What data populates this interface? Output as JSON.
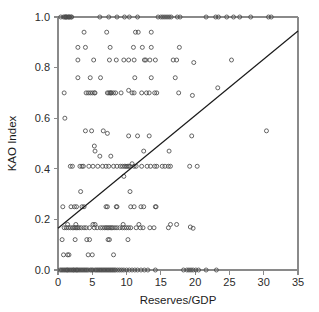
{
  "chart_data": {
    "type": "scatter",
    "title": "",
    "xlabel": "Reserves/GDP",
    "ylabel": "KAO Index",
    "xlim": [
      0,
      35
    ],
    "ylim": [
      0.0,
      1.0
    ],
    "xticks": [
      0,
      5,
      10,
      15,
      20,
      25,
      30,
      35
    ],
    "xtick_labels": [
      "0",
      "5",
      "10",
      "15",
      "20",
      "25",
      "30",
      "35"
    ],
    "yticks": [
      0.0,
      0.2,
      0.4,
      0.6,
      0.8,
      1.0
    ],
    "ytick_labels": [
      "0.0",
      "0.2",
      "0.4",
      "0.6",
      "0.8",
      "1.0"
    ],
    "grid": false,
    "legend": null,
    "marker": "open-circle",
    "marker_size": 4,
    "marker_color": "#4a4a4a",
    "series": [
      {
        "name": "Country observations",
        "points": [
          [
            0.4,
            1.0
          ],
          [
            0.8,
            1.0
          ],
          [
            1.0,
            1.0
          ],
          [
            1.1,
            1.0
          ],
          [
            1.2,
            1.0
          ],
          [
            1.3,
            1.0
          ],
          [
            1.5,
            1.0
          ],
          [
            1.6,
            1.0
          ],
          [
            1.7,
            1.0
          ],
          [
            1.9,
            1.0
          ],
          [
            2.0,
            1.0
          ],
          [
            6.1,
            1.0
          ],
          [
            7.4,
            1.0
          ],
          [
            8.6,
            1.0
          ],
          [
            9.7,
            1.0
          ],
          [
            10.4,
            1.0
          ],
          [
            11.6,
            1.0
          ],
          [
            14.6,
            1.0
          ],
          [
            15.0,
            1.0
          ],
          [
            15.3,
            1.0
          ],
          [
            15.6,
            1.0
          ],
          [
            15.9,
            1.0
          ],
          [
            16.2,
            1.0
          ],
          [
            16.5,
            1.0
          ],
          [
            17.4,
            1.0
          ],
          [
            17.8,
            1.0
          ],
          [
            21.6,
            1.0
          ],
          [
            23.0,
            1.0
          ],
          [
            23.4,
            1.0
          ],
          [
            24.6,
            1.0
          ],
          [
            25.6,
            1.0
          ],
          [
            26.5,
            1.0
          ],
          [
            28.1,
            1.0
          ],
          [
            30.7,
            1.0
          ],
          [
            31.1,
            1.0
          ],
          [
            3.8,
            0.94
          ],
          [
            7.1,
            0.94
          ],
          [
            11.3,
            0.94
          ],
          [
            11.7,
            0.94
          ],
          [
            13.6,
            0.94
          ],
          [
            2.9,
            0.88
          ],
          [
            4.0,
            0.88
          ],
          [
            7.6,
            0.88
          ],
          [
            11.0,
            0.88
          ],
          [
            12.3,
            0.88
          ],
          [
            13.6,
            0.88
          ],
          [
            17.7,
            0.88
          ],
          [
            2.9,
            0.83
          ],
          [
            5.2,
            0.83
          ],
          [
            7.5,
            0.83
          ],
          [
            8.5,
            0.83
          ],
          [
            9.6,
            0.83
          ],
          [
            10.3,
            0.83
          ],
          [
            11.1,
            0.83
          ],
          [
            12.6,
            0.83
          ],
          [
            12.8,
            0.83
          ],
          [
            13.4,
            0.83
          ],
          [
            14.2,
            0.83
          ],
          [
            16.8,
            0.83
          ],
          [
            17.3,
            0.83
          ],
          [
            19.8,
            0.82
          ],
          [
            25.3,
            0.83
          ],
          [
            2.9,
            0.76
          ],
          [
            4.7,
            0.76
          ],
          [
            6.2,
            0.76
          ],
          [
            11.2,
            0.76
          ],
          [
            13.6,
            0.76
          ],
          [
            17.1,
            0.76
          ],
          [
            23.3,
            0.72
          ],
          [
            0.9,
            0.7
          ],
          [
            4.1,
            0.7
          ],
          [
            4.4,
            0.7
          ],
          [
            4.7,
            0.7
          ],
          [
            5.0,
            0.7
          ],
          [
            5.3,
            0.7
          ],
          [
            5.4,
            0.7
          ],
          [
            7.2,
            0.7
          ],
          [
            7.4,
            0.7
          ],
          [
            7.6,
            0.7
          ],
          [
            7.7,
            0.7
          ],
          [
            7.8,
            0.7
          ],
          [
            8.1,
            0.7
          ],
          [
            8.4,
            0.7
          ],
          [
            9.2,
            0.7
          ],
          [
            10.3,
            0.71
          ],
          [
            10.8,
            0.7
          ],
          [
            11.1,
            0.7
          ],
          [
            12.2,
            0.7
          ],
          [
            12.9,
            0.7
          ],
          [
            13.3,
            0.7
          ],
          [
            14.1,
            0.7
          ],
          [
            14.4,
            0.7
          ],
          [
            17.6,
            0.7
          ],
          [
            19.6,
            0.69
          ],
          [
            1.0,
            0.6
          ],
          [
            4.0,
            0.55
          ],
          [
            4.9,
            0.55
          ],
          [
            6.6,
            0.55
          ],
          [
            30.4,
            0.55
          ],
          [
            10.3,
            0.53
          ],
          [
            11.6,
            0.53
          ],
          [
            13.3,
            0.53
          ],
          [
            19.5,
            0.53
          ],
          [
            7.2,
            0.54
          ],
          [
            5.3,
            0.49
          ],
          [
            5.4,
            0.47
          ],
          [
            12.5,
            0.47
          ],
          [
            16.2,
            0.47
          ],
          [
            6.1,
            0.45
          ],
          [
            7.7,
            0.45
          ],
          [
            1.8,
            0.41
          ],
          [
            2.1,
            0.41
          ],
          [
            3.2,
            0.41
          ],
          [
            3.5,
            0.41
          ],
          [
            3.7,
            0.41
          ],
          [
            4.5,
            0.41
          ],
          [
            5.1,
            0.41
          ],
          [
            5.8,
            0.41
          ],
          [
            6.5,
            0.41
          ],
          [
            7.0,
            0.41
          ],
          [
            7.4,
            0.41
          ],
          [
            8.1,
            0.41
          ],
          [
            8.6,
            0.41
          ],
          [
            9.1,
            0.41
          ],
          [
            9.4,
            0.41
          ],
          [
            9.7,
            0.41
          ],
          [
            9.9,
            0.41
          ],
          [
            10.1,
            0.41
          ],
          [
            10.3,
            0.41
          ],
          [
            10.5,
            0.41
          ],
          [
            10.8,
            0.42
          ],
          [
            11.1,
            0.41
          ],
          [
            11.4,
            0.41
          ],
          [
            12.2,
            0.41
          ],
          [
            13.0,
            0.41
          ],
          [
            13.5,
            0.41
          ],
          [
            14.1,
            0.41
          ],
          [
            14.4,
            0.41
          ],
          [
            15.2,
            0.41
          ],
          [
            15.6,
            0.41
          ],
          [
            16.1,
            0.41
          ],
          [
            16.4,
            0.41
          ],
          [
            19.2,
            0.41
          ],
          [
            20.3,
            0.41
          ],
          [
            9.6,
            0.37
          ],
          [
            3.3,
            0.31
          ],
          [
            10.5,
            0.31
          ],
          [
            0.7,
            0.25
          ],
          [
            1.9,
            0.25
          ],
          [
            2.4,
            0.25
          ],
          [
            2.7,
            0.25
          ],
          [
            3.5,
            0.25
          ],
          [
            3.8,
            0.25
          ],
          [
            7.0,
            0.25
          ],
          [
            7.2,
            0.25
          ],
          [
            8.5,
            0.25
          ],
          [
            8.6,
            0.25
          ],
          [
            10.6,
            0.25
          ],
          [
            11.1,
            0.25
          ],
          [
            12.1,
            0.25
          ],
          [
            12.5,
            0.25
          ],
          [
            14.2,
            0.25
          ],
          [
            14.3,
            0.25
          ],
          [
            1.4,
            0.18
          ],
          [
            2.6,
            0.18
          ],
          [
            5.1,
            0.18
          ],
          [
            5.4,
            0.18
          ],
          [
            9.5,
            0.18
          ],
          [
            11.8,
            0.18
          ],
          [
            16.4,
            0.18
          ],
          [
            17.3,
            0.18
          ],
          [
            19.3,
            0.17
          ],
          [
            0.9,
            0.167
          ],
          [
            1.2,
            0.167
          ],
          [
            1.5,
            0.167
          ],
          [
            1.8,
            0.167
          ],
          [
            2.1,
            0.167
          ],
          [
            2.3,
            0.167
          ],
          [
            2.5,
            0.167
          ],
          [
            2.7,
            0.167
          ],
          [
            2.9,
            0.167
          ],
          [
            3.1,
            0.167
          ],
          [
            3.4,
            0.167
          ],
          [
            3.8,
            0.167
          ],
          [
            4.1,
            0.167
          ],
          [
            4.6,
            0.167
          ],
          [
            5.3,
            0.167
          ],
          [
            5.7,
            0.167
          ],
          [
            6.2,
            0.167
          ],
          [
            6.5,
            0.167
          ],
          [
            6.8,
            0.167
          ],
          [
            7.0,
            0.167
          ],
          [
            7.2,
            0.167
          ],
          [
            7.4,
            0.167
          ],
          [
            7.6,
            0.167
          ],
          [
            7.8,
            0.167
          ],
          [
            8.0,
            0.167
          ],
          [
            8.3,
            0.167
          ],
          [
            8.6,
            0.167
          ],
          [
            9.0,
            0.167
          ],
          [
            9.4,
            0.167
          ],
          [
            9.7,
            0.167
          ],
          [
            10.0,
            0.167
          ],
          [
            10.3,
            0.167
          ],
          [
            10.6,
            0.167
          ],
          [
            11.4,
            0.167
          ],
          [
            12.0,
            0.167
          ],
          [
            12.4,
            0.167
          ],
          [
            13.4,
            0.167
          ],
          [
            14.0,
            0.167
          ],
          [
            16.1,
            0.167
          ],
          [
            19.7,
            0.165
          ],
          [
            0.6,
            0.12
          ],
          [
            2.5,
            0.12
          ],
          [
            4.2,
            0.12
          ],
          [
            4.6,
            0.12
          ],
          [
            7.3,
            0.12
          ],
          [
            7.5,
            0.12
          ],
          [
            10.2,
            0.12
          ],
          [
            0.8,
            0.06
          ],
          [
            1.4,
            0.06
          ],
          [
            1.6,
            0.06
          ],
          [
            4.4,
            0.06
          ],
          [
            5.0,
            0.06
          ],
          [
            8.1,
            0.06
          ],
          [
            0.3,
            0.0
          ],
          [
            0.5,
            0.0
          ],
          [
            0.7,
            0.0
          ],
          [
            0.9,
            0.0
          ],
          [
            1.1,
            0.0
          ],
          [
            1.3,
            0.0
          ],
          [
            1.4,
            0.0
          ],
          [
            1.6,
            0.0
          ],
          [
            1.8,
            0.0
          ],
          [
            2.0,
            0.0
          ],
          [
            2.2,
            0.0
          ],
          [
            2.3,
            0.0
          ],
          [
            2.5,
            0.0
          ],
          [
            2.7,
            0.0
          ],
          [
            2.8,
            0.0
          ],
          [
            3.0,
            0.0
          ],
          [
            3.2,
            0.0
          ],
          [
            3.4,
            0.0
          ],
          [
            3.6,
            0.0
          ],
          [
            3.8,
            0.0
          ],
          [
            4.0,
            0.0
          ],
          [
            4.2,
            0.0
          ],
          [
            4.4,
            0.0
          ],
          [
            4.7,
            0.0
          ],
          [
            4.9,
            0.0
          ],
          [
            5.1,
            0.0
          ],
          [
            5.4,
            0.0
          ],
          [
            5.6,
            0.0
          ],
          [
            5.8,
            0.0
          ],
          [
            6.0,
            0.0
          ],
          [
            6.2,
            0.0
          ],
          [
            6.4,
            0.0
          ],
          [
            6.6,
            0.0
          ],
          [
            6.8,
            0.0
          ],
          [
            7.0,
            0.0
          ],
          [
            7.2,
            0.0
          ],
          [
            7.4,
            0.0
          ],
          [
            7.6,
            0.0
          ],
          [
            7.8,
            0.0
          ],
          [
            8.0,
            0.0
          ],
          [
            8.2,
            0.0
          ],
          [
            8.4,
            0.0
          ],
          [
            8.7,
            0.0
          ],
          [
            9.0,
            0.0
          ],
          [
            9.3,
            0.0
          ],
          [
            9.6,
            0.0
          ],
          [
            10.0,
            0.0
          ],
          [
            10.4,
            0.0
          ],
          [
            10.8,
            0.0
          ],
          [
            11.2,
            0.0
          ],
          [
            11.6,
            0.0
          ],
          [
            12.1,
            0.0
          ],
          [
            12.6,
            0.0
          ],
          [
            13.1,
            0.0
          ],
          [
            14.2,
            0.0
          ],
          [
            18.3,
            0.0
          ],
          [
            18.8,
            0.0
          ],
          [
            19.1,
            0.0
          ],
          [
            19.4,
            0.0
          ],
          [
            19.7,
            0.0
          ],
          [
            20.1,
            0.0
          ],
          [
            20.5,
            0.0
          ],
          [
            21.6,
            0.0
          ],
          [
            23.1,
            0.0
          ]
        ]
      }
    ],
    "trendline": {
      "name": "fitted regression line",
      "x0": 0,
      "y0": 0.165,
      "x1": 35,
      "y1": 0.945,
      "color": "#1a1a1a"
    },
    "axis_color": "#8a8a8a",
    "background_color": "#ffffff"
  }
}
